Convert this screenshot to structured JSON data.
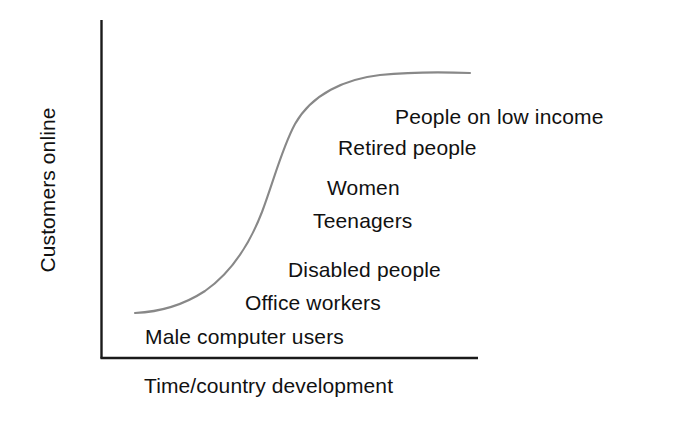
{
  "chart_data": {
    "type": "line",
    "title": "",
    "xlabel": "Time/country development",
    "ylabel": "Customers online",
    "grid": false,
    "legend": null,
    "axis_ticks": {
      "x": [],
      "y": []
    },
    "xlim": [
      0,
      100
    ],
    "ylim": [
      0,
      100
    ],
    "series": [
      {
        "name": "Adoption S-curve",
        "shape": "sigmoid",
        "x": [
          9,
          16,
          23,
          30,
          36,
          41,
          45,
          48,
          52,
          57,
          63,
          70,
          78,
          86,
          94,
          98
        ],
        "y": [
          13,
          15,
          19,
          25,
          34,
          46,
          58,
          67,
          75,
          82,
          88,
          92,
          95,
          97,
          98,
          98
        ],
        "color": "#888888",
        "linewidth": 2
      }
    ],
    "annotations": [
      {
        "id": "male-computer-users",
        "text": "Male computer users",
        "x": 12,
        "y": 12
      },
      {
        "id": "office-workers",
        "text": "Office workers",
        "x": 39,
        "y": 22
      },
      {
        "id": "disabled-people",
        "text": "Disabled people",
        "x": 50,
        "y": 32
      },
      {
        "id": "teenagers",
        "text": "Teenagers",
        "x": 56,
        "y": 46
      },
      {
        "id": "women",
        "text": "Women",
        "x": 60,
        "y": 56
      },
      {
        "id": "retired-people",
        "text": "Retired people",
        "x": 63,
        "y": 68
      },
      {
        "id": "people-on-low-income",
        "text": "People on low income",
        "x": 78,
        "y": 78
      }
    ]
  },
  "axes": {
    "y_label": "Customers online",
    "x_label": "Time/country development",
    "axis_color": "#1a1a1a"
  },
  "curve": {
    "color": "#888888",
    "path": "M 135 313 C 158 312, 182 306, 205 291 C 228 275, 248 248, 262 212 C 274 180, 282 148, 295 124 C 312 94, 345 79, 380 75 C 410 72, 445 72, 470 73"
  },
  "labels": [
    "Male computer users",
    "Office workers",
    "Disabled people",
    "Teenagers",
    "Women",
    "Retired people",
    "People on low income"
  ]
}
